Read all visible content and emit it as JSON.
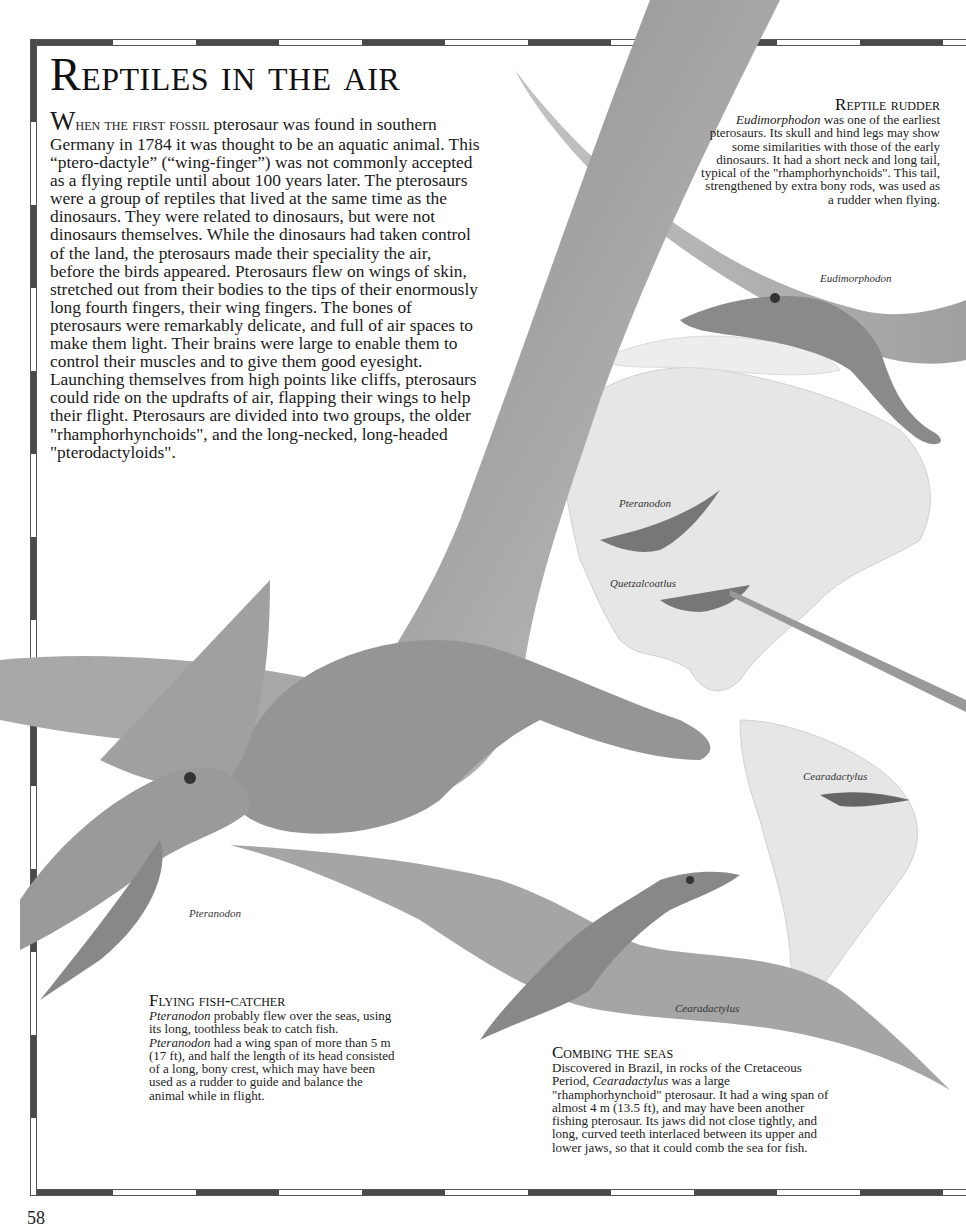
{
  "page": {
    "title": "Reptiles in the air",
    "page_number": "58",
    "colors": {
      "frame_dark": "#4a4a4a",
      "frame_light": "#ffffff",
      "text": "#1a1a1a",
      "background": "#ffffff"
    }
  },
  "intro": {
    "dropcap": "W",
    "lead": "hen the first fossil",
    "body": " pterosaur was found in southern Germany in 1784 it was thought to be an aquatic animal. This “ptero-dactyle” (“wing-finger”) was not commonly accepted as a flying reptile until about 100 years later. The pterosaurs were a group of reptiles that lived at the same time as the dinosaurs. They were related to dinosaurs, but were not dinosaurs themselves. While the dinosaurs had taken control of the land, the pterosaurs made their speciality the air, before the birds appeared. Pterosaurs flew on wings of skin, stretched out from their bodies to the tips of their enormously long fourth fingers, their wing fingers. The bones of pterosaurs were remarkably delicate, and full of air spaces to make them light. Their brains were large to enable them to control their muscles and to give them good eyesight. Launching themselves from high points like cliffs, pterosaurs could ride on the updrafts of air, flapping their wings to help their flight. Pterosaurs are divided into two groups, the older \"rhamphorhynchoids\", and the long-necked, long-headed \"pterodactyloids\"."
  },
  "captions": {
    "rudder": {
      "title": "Reptile rudder",
      "italic": "Eudimorphodon",
      "body": " was one of the earliest pterosaurs. Its skull and hind legs may show some similarities with those of the early dinosaurs. It had a short neck and long tail, typical of the \"rhamphorhynchoids\". This tail, strengthened by extra bony rods, was used as a rudder when flying."
    },
    "fish": {
      "title": "Flying fish-catcher",
      "italic1": "Pteranodon",
      "body1": " probably flew over the seas, using its long, toothless beak to catch fish.  ",
      "italic2": "Pteranodon",
      "body2": " had a wing span of more than 5 m (17 ft), and half the length of its head consisted of a long, bony crest, which may have been used as a rudder to guide and balance the animal while in flight."
    },
    "seas": {
      "title": "Combing the seas",
      "body1": "Discovered in Brazil, in rocks of the Cretaceous Period, ",
      "italic": "Cearadactylus",
      "body2": " was a large \"rhamphorhynchoid\" pterosaur. It had a wing span of almost 4 m (13.5 ft), and may have been another fishing pterosaur. Its jaws did not close tightly, and long, curved teeth interlaced between its upper and lower jaws, so that it could comb the sea for fish."
    }
  },
  "labels": {
    "eudimorphodon": "Eudimorphodon",
    "pteranodon_map": "Pteranodon",
    "quetzalcoatlus_map": "Quetzalcoatlus",
    "cearadactylus_map": "Cearadactylus",
    "pteranodon_main": "Pteranodon",
    "cearadactylus_main": "Cearadactylus"
  }
}
